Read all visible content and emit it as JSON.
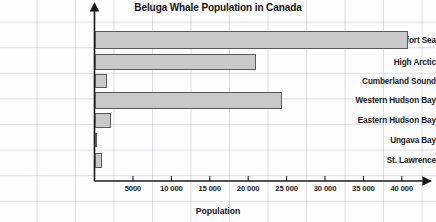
{
  "chart_data": {
    "type": "bar",
    "orientation": "horizontal",
    "title": "Beluga Whale Population in Canada",
    "xlabel": "Population",
    "ylabel": "",
    "categories": [
      "Beaufort Sea",
      "High Arctic",
      "Cumberland Sound",
      "Western Hudson Bay",
      "Eastern Hudson Bay",
      "Ungava Bay",
      "St. Lawrence"
    ],
    "values": [
      40800,
      21000,
      1600,
      24400,
      2100,
      0,
      1000
    ],
    "xlim": [
      0,
      42000
    ],
    "xticks": [
      5000,
      10000,
      15000,
      20000,
      25000,
      30000,
      35000,
      40000
    ],
    "xtick_labels": [
      "5000",
      "10 000",
      "15 000",
      "20 000",
      "25 000",
      "30 000",
      "35 000",
      "40 000"
    ],
    "grid": true,
    "legend": false,
    "bar_color": "#c9c9c9",
    "bar_border_color": "#5a5a5a",
    "axis_color": "#1a1a1a"
  }
}
